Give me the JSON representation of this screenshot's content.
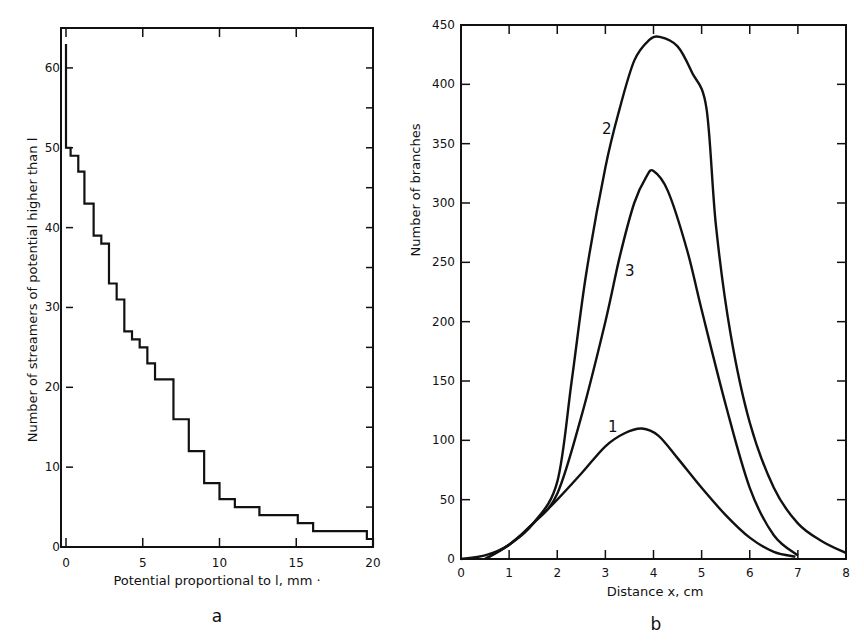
{
  "chart_data": [
    {
      "panel": "a",
      "type": "line",
      "step": true,
      "title": "",
      "xlabel": "Potential proportional to l, mm",
      "ylabel": "Number of streamers of potential higher than l",
      "xlim": [
        0,
        20
      ],
      "ylim": [
        0,
        65
      ],
      "xticks": [
        0,
        5,
        10,
        15,
        20
      ],
      "yticks": [
        0,
        10,
        20,
        30,
        40,
        50,
        60
      ],
      "grid": false,
      "legend": null,
      "series": [
        {
          "name": "streamers",
          "x": [
            0,
            0,
            0.3,
            0.3,
            0.8,
            0.8,
            1.2,
            1.2,
            1.8,
            1.8,
            2.3,
            2.3,
            2.8,
            2.8,
            3.3,
            3.3,
            3.8,
            3.8,
            4.3,
            4.3,
            4.8,
            4.8,
            5.3,
            5.3,
            5.8,
            5.8,
            7.0,
            7.0,
            8.0,
            8.0,
            9.0,
            9.0,
            10.0,
            10.0,
            11.0,
            11.0,
            12.6,
            12.6,
            15.1,
            15.1,
            16.1,
            16.1,
            19.6,
            19.6,
            20.0,
            20.0
          ],
          "y": [
            63,
            50,
            50,
            49,
            49,
            47,
            47,
            43,
            43,
            39,
            39,
            38,
            38,
            33,
            33,
            31,
            31,
            27,
            27,
            26,
            26,
            25,
            25,
            23,
            23,
            21,
            21,
            16,
            16,
            12,
            12,
            8,
            8,
            6,
            6,
            5,
            5,
            4,
            4,
            3,
            3,
            2,
            2,
            1,
            1,
            0
          ]
        }
      ]
    },
    {
      "panel": "b",
      "type": "line",
      "title": "",
      "xlabel": "Distance x, cm",
      "ylabel": "Number of branches",
      "xlim": [
        0,
        8
      ],
      "ylim": [
        0,
        450
      ],
      "xticks": [
        0,
        1,
        2,
        3,
        4,
        5,
        6,
        7,
        8
      ],
      "yticks": [
        0,
        50,
        100,
        150,
        200,
        250,
        300,
        350,
        400,
        450
      ],
      "grid": false,
      "legend": null,
      "series": [
        {
          "name": "1",
          "x": [
            0,
            0.5,
            1.0,
            1.5,
            2.0,
            2.5,
            3.0,
            3.4,
            3.76,
            4.1,
            4.5,
            5.0,
            5.5,
            6.0,
            6.5,
            6.95
          ],
          "y": [
            0,
            3,
            12,
            30,
            50,
            72,
            95,
            106,
            110,
            104,
            85,
            60,
            37,
            18,
            6,
            2
          ]
        },
        {
          "name": "2",
          "x": [
            0.5,
            1.0,
            1.5,
            2.0,
            2.3,
            2.6,
            3.0,
            3.3,
            3.6,
            3.9,
            4.13,
            4.5,
            4.8,
            5.1,
            5.3,
            5.6,
            6.0,
            6.5,
            7.0,
            7.5,
            8.0
          ],
          "y": [
            0,
            12,
            30,
            65,
            150,
            240,
            330,
            380,
            420,
            437,
            440,
            432,
            410,
            380,
            280,
            190,
            115,
            60,
            30,
            15,
            5
          ]
        },
        {
          "name": "3",
          "x": [
            0.5,
            1.0,
            1.5,
            2.0,
            2.5,
            3.0,
            3.3,
            3.6,
            3.85,
            4.0,
            4.3,
            4.7,
            5.0,
            5.5,
            6.0,
            6.5,
            7.0
          ],
          "y": [
            0,
            12,
            30,
            55,
            120,
            200,
            255,
            300,
            322,
            327,
            310,
            260,
            210,
            130,
            60,
            20,
            3
          ]
        }
      ],
      "annotations": [
        {
          "text": "1",
          "x": 3.2,
          "y": 115
        },
        {
          "text": "2",
          "x": 2.3,
          "y": 360
        },
        {
          "text": "3",
          "x": 2.8,
          "y": 240
        }
      ]
    }
  ],
  "panels": {
    "a": {
      "letter": "a",
      "xlabel": "Potential proportional to l, mm ·",
      "ylabel": "Number of streamers of potential higher than l",
      "xtick_labels": [
        "0",
        "5",
        "10",
        "15",
        "20"
      ],
      "ytick_labels": [
        "0",
        "10",
        "20",
        "30",
        "40",
        "50",
        "60"
      ]
    },
    "b": {
      "letter": "b",
      "xlabel": "Distance x, cm",
      "ylabel": "Number of branches",
      "xtick_labels": [
        "0",
        "1",
        "2",
        "3",
        "4",
        "5",
        "6",
        "7",
        "8"
      ],
      "ytick_labels": [
        "0",
        "50",
        "100",
        "150",
        "200",
        "250",
        "300",
        "350",
        "400",
        "450"
      ],
      "curve_labels": [
        "1",
        "2",
        "3"
      ]
    }
  }
}
